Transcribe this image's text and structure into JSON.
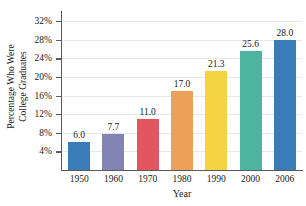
{
  "chart_data": {
    "type": "bar",
    "title": "",
    "xlabel": "Year",
    "ylabel": "Percentage Who Were College Graduates",
    "ylabel_line1": "Percentage Who Were",
    "ylabel_line2": "College Graduates",
    "categories": [
      "1950",
      "1960",
      "1970",
      "1980",
      "1990",
      "2000",
      "2006"
    ],
    "values": [
      6.0,
      7.7,
      11.0,
      17.0,
      21.3,
      25.6,
      28.0
    ],
    "value_labels": [
      "6.0",
      "7.7",
      "11.0",
      "17.0",
      "21.3",
      "25.6",
      "28.0"
    ],
    "bar_colors": [
      "#3a7cb8",
      "#8484b4",
      "#e05560",
      "#eda05a",
      "#f5d443",
      "#4db4a0",
      "#3a7cb8"
    ],
    "ylim": [
      0,
      34
    ],
    "yticks": [
      4,
      8,
      12,
      16,
      20,
      24,
      28,
      32
    ],
    "ytick_labels": [
      "4%",
      "8%",
      "12%",
      "16%",
      "20%",
      "24%",
      "28%",
      "32%"
    ],
    "grid": true,
    "grid_color": "#e8e8e8",
    "axis_color": "#5a5a5a",
    "legend": "none",
    "background": "#ffffff"
  }
}
